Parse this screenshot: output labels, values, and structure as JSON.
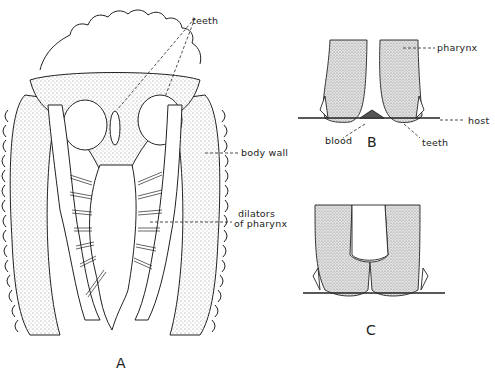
{
  "figure": {
    "panels": [
      {
        "id": "A",
        "label": "A"
      },
      {
        "id": "B",
        "label": "B"
      },
      {
        "id": "C",
        "label": "C"
      }
    ],
    "labels_A": {
      "teeth": "teeth",
      "body_wall": "body wall",
      "dilators_line1": "dilators",
      "dilators_line2": "of pharynx"
    },
    "labels_B": {
      "pharynx": "pharynx",
      "host": "host",
      "blood": "blood",
      "teeth": "teeth"
    },
    "colors": {
      "ink": "#222222",
      "stipple": "#9a9a9a",
      "background": "#ffffff"
    }
  }
}
